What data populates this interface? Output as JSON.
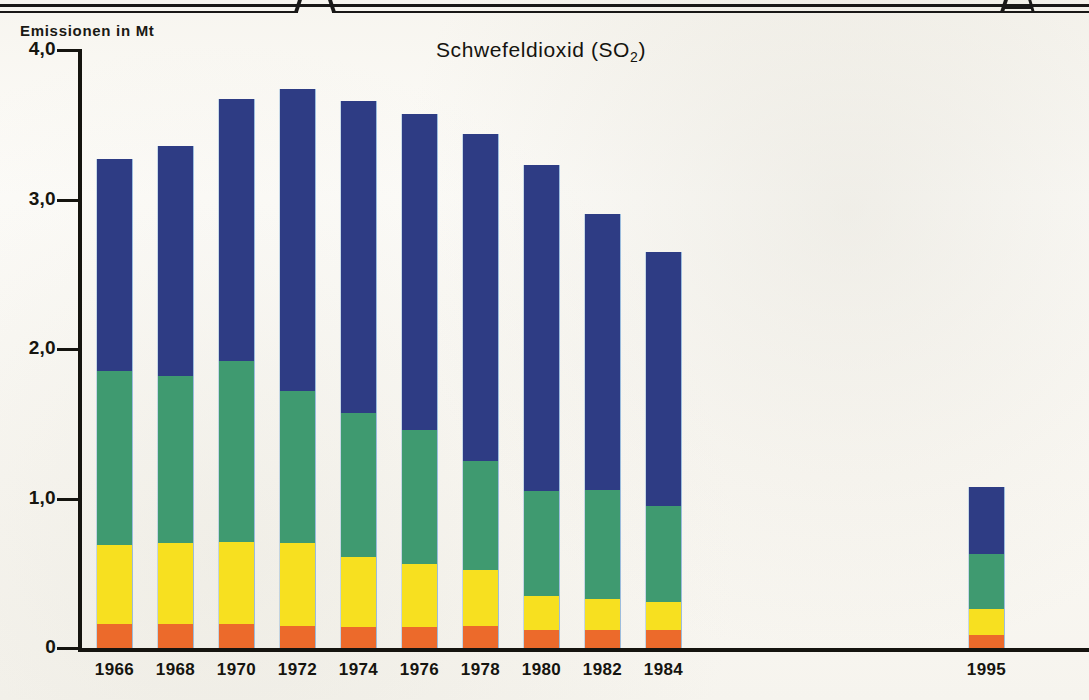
{
  "figure": {
    "title": "Schwefeldioxid (SO2)",
    "title_main": "Schwefeldioxid (SO",
    "title_sub": "2",
    "title_tail": ")",
    "axis_title": "Emissionen in Mt"
  },
  "chart_data": {
    "type": "bar",
    "subtype": "stacked-bar",
    "title": "Schwefeldioxid (SO2)",
    "xlabel": "",
    "ylabel": "Emissionen in Mt",
    "ylim": [
      0,
      4.0
    ],
    "yticks": [
      0,
      1.0,
      2.0,
      3.0,
      4.0
    ],
    "ytick_labels": [
      "0",
      "1,0",
      "2,0",
      "3,0",
      "4,0"
    ],
    "grid": false,
    "legend": false,
    "categories": [
      "1966",
      "1968",
      "1970",
      "1972",
      "1974",
      "1976",
      "1978",
      "1980",
      "1982",
      "1984",
      "1995"
    ],
    "series": [
      {
        "name": "Segment 1 (unten)",
        "color": "#ec6a2b",
        "values": [
          0.16,
          0.16,
          0.16,
          0.15,
          0.14,
          0.14,
          0.15,
          0.12,
          0.12,
          0.12,
          0.09
        ]
      },
      {
        "name": "Segment 2",
        "color": "#f7e020",
        "values": [
          0.53,
          0.54,
          0.55,
          0.55,
          0.47,
          0.42,
          0.37,
          0.23,
          0.21,
          0.19,
          0.17
        ]
      },
      {
        "name": "Segment 3",
        "color": "#3f9a70",
        "values": [
          1.16,
          1.12,
          1.21,
          1.02,
          0.96,
          0.9,
          0.73,
          0.7,
          0.73,
          0.64,
          0.37
        ]
      },
      {
        "name": "Segment 4 (oben)",
        "color": "#2e3c84",
        "values": [
          1.42,
          1.54,
          1.75,
          2.02,
          2.09,
          2.11,
          2.19,
          2.18,
          1.84,
          1.7,
          0.45
        ]
      }
    ],
    "totals": [
      3.27,
      3.36,
      3.67,
      3.74,
      3.66,
      3.57,
      3.44,
      3.23,
      2.9,
      2.65,
      1.08
    ],
    "gap_after_category": "1984",
    "note": "Lücke zwischen 1984 und 1995"
  },
  "colors": {
    "segment_bottom": "#ec6a2b",
    "segment_two": "#f7e020",
    "segment_three": "#3f9a70",
    "segment_top": "#2e3c84",
    "axis": "#15140f",
    "paper": "#fbfaf7"
  }
}
